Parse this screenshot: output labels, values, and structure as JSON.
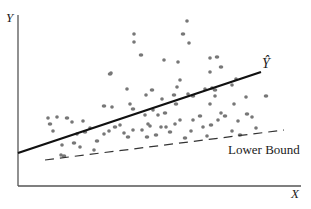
{
  "chart_data": {
    "type": "scatter",
    "title": "",
    "xlabel": "X",
    "ylabel": "Y",
    "units": "normalized plot coordinates (0-100) estimated from pixel positions; axes have no ticks or scale labels, so no true data values are recoverable",
    "grid": false,
    "legend": "none",
    "xlim": [
      0,
      100
    ],
    "ylim": [
      0,
      100
    ],
    "axes_ticks": "none",
    "annotations": [
      {
        "text": "Ŷ",
        "attached_to": "regression_line",
        "position": "right end of line"
      },
      {
        "text": "Lower Bound",
        "attached_to": "lower_bound_line",
        "position": "below right end of dashed line"
      }
    ],
    "lines": [
      {
        "name": "Ŷ",
        "style": "solid",
        "color": "#111111",
        "from": [
          0,
          18.8
        ],
        "to": [
          85.9,
          66.5
        ]
      },
      {
        "name": "Lower Bound",
        "style": "dashed",
        "color": "#333333",
        "from": [
          9.5,
          14.7
        ],
        "to": [
          94.0,
          32.4
        ]
      }
    ],
    "series": [
      {
        "name": "observations",
        "color": "#777777",
        "points_approx_px": [
          [
            64,
            156
          ],
          [
            61,
            155
          ],
          [
            62,
            145
          ],
          [
            74,
            143
          ],
          [
            80,
            147
          ],
          [
            94,
            150
          ],
          [
            97,
            141
          ],
          [
            104,
            134
          ],
          [
            90,
            128
          ],
          [
            85,
            132
          ],
          [
            77,
            134
          ],
          [
            109,
            131
          ],
          [
            115,
            127
          ],
          [
            120,
            125
          ],
          [
            124,
            133
          ],
          [
            128,
            137
          ],
          [
            133,
            130
          ],
          [
            142,
            130
          ],
          [
            147,
            137
          ],
          [
            148,
            124
          ],
          [
            150,
            126
          ],
          [
            156,
            135
          ],
          [
            161,
            127
          ],
          [
            166,
            127
          ],
          [
            170,
            132
          ],
          [
            175,
            124
          ],
          [
            180,
            120
          ],
          [
            185,
            138
          ],
          [
            191,
            131
          ],
          [
            193,
            120
          ],
          [
            200,
            116
          ],
          [
            203,
            127
          ],
          [
            207,
            136
          ],
          [
            211,
            125
          ],
          [
            218,
            120
          ],
          [
            221,
            113
          ],
          [
            225,
            116
          ],
          [
            234,
            104
          ],
          [
            238,
            121
          ],
          [
            247,
            114
          ],
          [
            252,
            117
          ],
          [
            256,
            128
          ],
          [
            240,
            135
          ],
          [
            232,
            131
          ],
          [
            158,
            115
          ],
          [
            165,
            113
          ],
          [
            153,
            110
          ],
          [
            145,
            115
          ],
          [
            50,
            124
          ],
          [
            53,
            131
          ],
          [
            57,
            117
          ],
          [
            67,
            118
          ],
          [
            72,
            122
          ],
          [
            83,
            121
          ],
          [
            104,
            106
          ],
          [
            112,
            107
          ],
          [
            130,
            104
          ],
          [
            133,
            109
          ],
          [
            146,
            95
          ],
          [
            162,
            99
          ],
          [
            176,
            104
          ],
          [
            210,
            104
          ],
          [
            48,
            118
          ],
          [
            141,
            55
          ],
          [
            164,
            60
          ],
          [
            212,
            88
          ],
          [
            215,
            90
          ],
          [
            180,
            80
          ],
          [
            177,
            87
          ],
          [
            174,
            95
          ],
          [
            188,
            94
          ],
          [
            205,
            89
          ],
          [
            193,
            96
          ],
          [
            215,
            96
          ],
          [
            210,
            72
          ],
          [
            221,
            67
          ],
          [
            232,
            85
          ],
          [
            178,
            62
          ],
          [
            152,
            90
          ],
          [
            187,
            21
          ],
          [
            127,
            89
          ],
          [
            183,
            34
          ],
          [
            189,
            43
          ],
          [
            210,
            58
          ],
          [
            217,
            57
          ],
          [
            236,
            79
          ],
          [
            246,
            97
          ],
          [
            266,
            96
          ],
          [
            134,
            42
          ],
          [
            134,
            34
          ],
          [
            110,
            74
          ],
          [
            111,
            73
          ]
        ]
      }
    ]
  },
  "labels": {
    "y_axis": "Y",
    "x_axis": "X",
    "yhat": "Ŷ",
    "lower_bound": "Lower Bound"
  }
}
